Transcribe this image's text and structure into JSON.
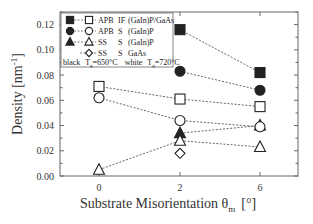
{
  "chart_data": {
    "type": "line",
    "title": "",
    "xlabel": "Substrate Misorientation θm [°]",
    "xlabel_main": "Substrate Misorientation θ",
    "xlabel_sub": "m",
    "xlabel_unit": "[°]",
    "ylabel": "Density [nm⁻¹]",
    "ylabel_main": "Density  [nm",
    "ylabel_sup": "-1",
    "ylabel_close": "]",
    "x": [
      0,
      2,
      6
    ],
    "x_tick_labels": [
      "0",
      "2",
      "6"
    ],
    "ylim": [
      0.0,
      0.13
    ],
    "y_ticks": [
      0.0,
      0.02,
      0.04,
      0.06,
      0.08,
      0.1,
      0.12
    ],
    "y_tick_labels": [
      "0.00",
      "0.02",
      "0.04",
      "0.06",
      "0.08",
      "0.10",
      "0.12"
    ],
    "grid": false,
    "legend_position": "upper-left inside",
    "series": [
      {
        "name": "APB IF (GaIn)P/GaAs, Tg=650°C",
        "marker": "filled-square",
        "x": [
          2,
          6
        ],
        "values": [
          0.116,
          0.082
        ]
      },
      {
        "name": "APB S (GaIn)P, Tg=650°C",
        "marker": "filled-circle",
        "x": [
          2,
          6
        ],
        "values": [
          0.083,
          0.068
        ]
      },
      {
        "name": "SS S (GaIn)P, Tg=650°C",
        "marker": "filled-triangle",
        "x": [
          2,
          6
        ],
        "values": [
          0.034,
          0.04
        ]
      },
      {
        "name": "APB IF (GaIn)P/GaAs, Tg=720°C",
        "marker": "open-square",
        "x": [
          0,
          2,
          6
        ],
        "values": [
          0.071,
          0.061,
          0.055
        ]
      },
      {
        "name": "APB S (GaIn)P, Tg=720°C",
        "marker": "open-circle",
        "x": [
          0,
          2,
          6
        ],
        "values": [
          0.062,
          0.044,
          0.039
        ]
      },
      {
        "name": "SS S (GaIn)P, Tg=720°C",
        "marker": "open-triangle",
        "x": [
          0,
          2,
          6
        ],
        "values": [
          0.005,
          0.028,
          0.023
        ]
      },
      {
        "name": "SS S GaAs, Tg=720°C",
        "marker": "open-diamond",
        "x": [
          2
        ],
        "values": [
          0.018
        ]
      }
    ],
    "legend": {
      "rows": [
        {
          "markers": [
            "filled-square",
            "open-square"
          ],
          "col1": "APB",
          "col2": "IF",
          "col3": "(GaIn)P/GaAs"
        },
        {
          "markers": [
            "filled-circle",
            "open-circle"
          ],
          "col1": "APB",
          "col2": "S",
          "col3": "(GaIn)P"
        },
        {
          "markers": [
            "filled-triangle",
            "open-triangle"
          ],
          "col1": "SS",
          "col2": "S",
          "col3": "(GaIn)P"
        },
        {
          "markers": [
            "open-diamond"
          ],
          "col1": "SS",
          "col2": "S",
          "col3": "GaAs"
        }
      ],
      "footer_black": "black",
      "footer_black_temp": "T",
      "footer_black_sub": "g",
      "footer_black_val": "=650°C",
      "footer_white": "white",
      "footer_white_temp": "T",
      "footer_white_sub": "g",
      "footer_white_val": "=720°C"
    },
    "colors": {
      "axis": "#555555",
      "marker": "#222222",
      "line": "#555555",
      "background": "#ffffff"
    }
  }
}
